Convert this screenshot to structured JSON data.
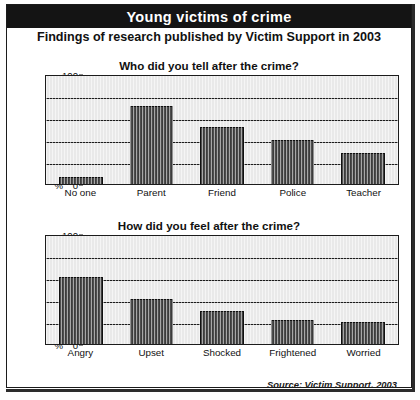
{
  "banner": {
    "title": "Young victims of crime"
  },
  "subtitle": "Findings of research published by Victim Support in 2003",
  "source": "Source: Victim Support, 2003",
  "axis": {
    "percent_symbol": "%",
    "ticks": [
      "100",
      "80",
      "60",
      "40",
      "20",
      "0"
    ]
  },
  "colors": {
    "banner_background": "#141414",
    "banner_text": "#ffffff",
    "plot_background": "#e9e9e9",
    "bar_fill": "#3c3c3c",
    "gridline": "#1c1c1c",
    "frame": "#1a1a1a"
  },
  "chart_data": [
    {
      "type": "bar",
      "title": "Who did you tell after the crime?",
      "categories": [
        "No one",
        "Parent",
        "Friend",
        "Police",
        "Teacher"
      ],
      "values": [
        6,
        71,
        52,
        40,
        28
      ],
      "xlabel": "",
      "ylabel": "%",
      "ylim": [
        0,
        100
      ],
      "yticks": [
        0,
        20,
        40,
        60,
        80,
        100
      ],
      "grid": true,
      "legend": "none"
    },
    {
      "type": "bar",
      "title": "How did you feel after the crime?",
      "categories": [
        "Angry",
        "Upset",
        "Shocked",
        "Frightened",
        "Worried"
      ],
      "values": [
        61,
        41,
        30,
        22,
        20
      ],
      "xlabel": "",
      "ylabel": "%",
      "ylim": [
        0,
        100
      ],
      "yticks": [
        0,
        20,
        40,
        60,
        80,
        100
      ],
      "grid": true,
      "legend": "none"
    }
  ]
}
